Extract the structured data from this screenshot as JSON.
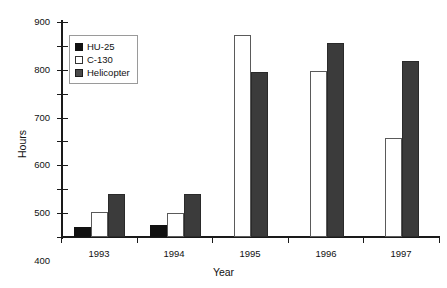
{
  "chart_data": {
    "type": "bar",
    "title": "",
    "xlabel": "Year",
    "ylabel": "Hours",
    "categories": [
      "1993",
      "1994",
      "1995",
      "1996",
      "1997"
    ],
    "series": [
      {
        "name": "HU-25",
        "values": [
          40,
          50,
          0,
          0,
          0
        ],
        "color": "#111111"
      },
      {
        "name": "C-130",
        "values": [
          105,
          100,
          845,
          695,
          415
        ],
        "color": "#ffffff"
      },
      {
        "name": "Helicopter",
        "values": [
          180,
          180,
          690,
          810,
          735
        ],
        "color": "#3b3b3b"
      }
    ],
    "ylim": [
      0,
      900
    ],
    "ytick_step": 100,
    "yticks": [
      "0",
      "100",
      "200",
      "300",
      "400",
      "500",
      "600",
      "700",
      "800",
      "900"
    ],
    "grid": false,
    "legend_position": "top-left-inside"
  },
  "legend": {
    "items": [
      {
        "label": "HU-25",
        "swatch": "filled-black-square"
      },
      {
        "label": "C-130",
        "swatch": "open-white-square"
      },
      {
        "label": "Helicopter",
        "swatch": "filled-gray-square"
      }
    ]
  },
  "axes": {
    "y_title": "Hours",
    "x_title": "Year"
  }
}
